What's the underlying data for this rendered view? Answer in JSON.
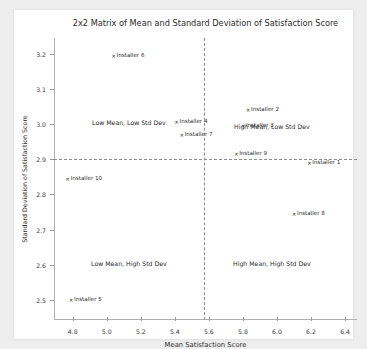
{
  "figure": {
    "background": "#eeeeee",
    "panel_background": "#ffffff"
  },
  "chart_data": {
    "type": "scatter",
    "title": "2x2 Matrix of Mean and Standard Deviation of Satisfaction Score",
    "xlabel": "Mean Satisfaction Score",
    "ylabel": "Standard Deviation of Satisfaction Score",
    "xlim": [
      4.69,
      6.47
    ],
    "ylim": [
      2.443,
      3.245
    ],
    "xticks": [
      "4.8",
      "5.0",
      "5.2",
      "5.4",
      "5.6",
      "5.8",
      "6.0",
      "6.2",
      "6.4"
    ],
    "xtick_values": [
      4.8,
      5.0,
      5.2,
      5.4,
      5.6,
      5.8,
      6.0,
      6.2,
      6.4
    ],
    "yticks": [
      "2.5",
      "2.6",
      "2.7",
      "2.8",
      "2.9",
      "3.0",
      "3.1",
      "3.2"
    ],
    "ytick_values": [
      2.5,
      2.6,
      2.7,
      2.8,
      2.9,
      3.0,
      3.1,
      3.2
    ],
    "grid": false,
    "legend": null,
    "marker_color": "#2a2a2a",
    "reference_lines": {
      "vertical_x": 5.57,
      "horizontal_y": 2.9,
      "style": "dashed",
      "color": "#8d8d8d"
    },
    "points": [
      {
        "label": "Installer 6",
        "x": 5.04,
        "y": 3.195
      },
      {
        "label": "Installer 4",
        "x": 5.41,
        "y": 3.005
      },
      {
        "label": "Installer 2",
        "x": 5.83,
        "y": 3.04
      },
      {
        "label": "Installer 3",
        "x": 5.8,
        "y": 2.995
      },
      {
        "label": "Installer 7",
        "x": 5.44,
        "y": 2.97
      },
      {
        "label": "Installer 9",
        "x": 5.76,
        "y": 2.915
      },
      {
        "label": "Installer 1",
        "x": 6.19,
        "y": 2.89
      },
      {
        "label": "Installer 10",
        "x": 4.77,
        "y": 2.845
      },
      {
        "label": "Installer 8",
        "x": 6.1,
        "y": 2.745
      },
      {
        "label": "Installer 5",
        "x": 4.79,
        "y": 2.5
      }
    ],
    "annotations": [
      {
        "text": "Low Mean, Low Std Dev",
        "x": 5.13,
        "y": 3.005
      },
      {
        "text": "High Mean, Low Std Dev",
        "x": 5.97,
        "y": 2.995
      },
      {
        "text": "Low Mean, High Std Dev",
        "x": 5.13,
        "y": 2.605
      },
      {
        "text": "High Mean, High Std Dev",
        "x": 5.97,
        "y": 2.605
      }
    ]
  }
}
